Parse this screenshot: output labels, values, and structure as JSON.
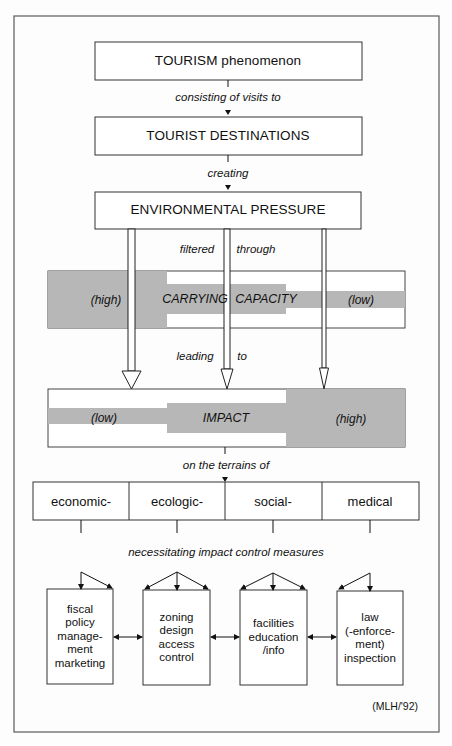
{
  "boxes": {
    "tourism": "TOURISM phenomenon",
    "destinations": "TOURIST DESTINATIONS",
    "pressure": "ENVIRONMENTAL PRESSURE"
  },
  "connectors": {
    "visits": "consisting of visits to",
    "creating": "creating",
    "filtered": "filtered",
    "through": "through",
    "leading": "leading",
    "to": "to",
    "terrains": "on the terrains of",
    "necessitating": "necessitating impact control measures"
  },
  "carrying_capacity": {
    "high_label": "(high)",
    "word1": "CARRYING",
    "word2": "CAPACITY",
    "low_label": "(low)",
    "levels": [
      "high",
      "medium",
      "low"
    ]
  },
  "impact": {
    "low_label": "(low)",
    "word": "IMPACT",
    "high_label": "(high)",
    "levels": [
      "low",
      "medium",
      "high"
    ]
  },
  "terrains": [
    "economic-",
    "ecologic-",
    "social-",
    "medical"
  ],
  "measures": [
    {
      "lines": [
        "fiscal",
        "policy",
        "manage-",
        "ment",
        "marketing"
      ]
    },
    {
      "lines": [
        "zoning",
        "design",
        "access",
        "control"
      ]
    },
    {
      "lines": [
        "facilities",
        "education",
        "/info"
      ]
    },
    {
      "lines": [
        "law",
        "(-enforce-",
        "ment)",
        "inspection"
      ]
    }
  ],
  "credit": "(MLH/'92)",
  "colors": {
    "line": "#1a1a1a",
    "frame": "#5a5a5a",
    "shade": "#b7b7b7"
  }
}
